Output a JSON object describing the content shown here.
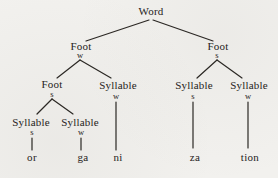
{
  "colors": {
    "background": "#f2f1ee",
    "ink": "#262321",
    "line": "#2b2824"
  },
  "tree": {
    "root": {
      "label": "Word"
    },
    "foot_left": {
      "label": "Foot",
      "stress": "w"
    },
    "foot_right": {
      "label": "Foot",
      "stress": "s"
    },
    "foot_left_inner": {
      "label": "Foot",
      "stress": "s"
    },
    "syllable_mid": {
      "label": "Syllable",
      "stress": "w"
    },
    "syllable_left_s": {
      "label": "Syllable",
      "stress": "s"
    },
    "syllable_left_w": {
      "label": "Syllable",
      "stress": "w"
    },
    "syllable_right_s": {
      "label": "Syllable",
      "stress": "s"
    },
    "syllable_right_w": {
      "label": "Syllable",
      "stress": "w"
    },
    "leaves": {
      "or": "or",
      "ga": "ga",
      "ni": "ni",
      "za": "za",
      "tion": "tion"
    }
  }
}
